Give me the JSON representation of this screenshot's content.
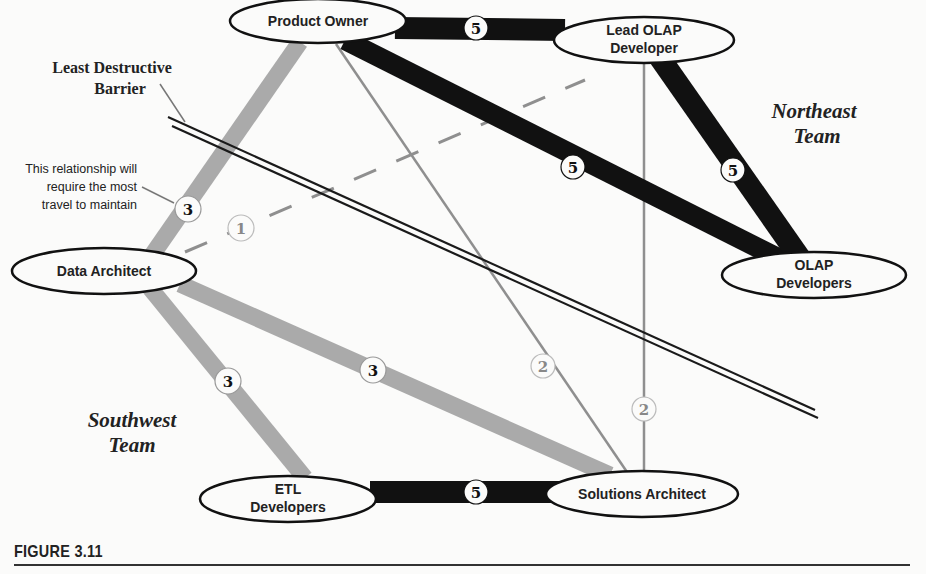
{
  "figure": {
    "caption": "FIGURE 3.11"
  },
  "annotations": {
    "barrier_line1": "Least Destructive",
    "barrier_line2": "Barrier",
    "note_line1": "This relationship will",
    "note_line2": "require the most",
    "note_line3": "travel to maintain"
  },
  "teams": {
    "northeast_line1": "Northeast",
    "northeast_line2": "Team",
    "southwest_line1": "Southwest",
    "southwest_line2": "Team"
  },
  "nodes": {
    "product_owner": {
      "label1": "Product Owner"
    },
    "lead_olap": {
      "label1": "Lead OLAP",
      "label2": "Developer"
    },
    "olap_devs": {
      "label1": "OLAP",
      "label2": "Developers"
    },
    "data_architect": {
      "label1": "Data Architect"
    },
    "etl_devs": {
      "label1": "ETL",
      "label2": "Developers"
    },
    "solutions_architect": {
      "label1": "Solutions Architect"
    }
  },
  "edges": {
    "po_lead": {
      "weight": "5"
    },
    "po_olap": {
      "weight": "5"
    },
    "lead_olap": {
      "weight": "5"
    },
    "etl_sa": {
      "weight": "5"
    },
    "po_da": {
      "weight": "3"
    },
    "da_etl": {
      "weight": "3"
    },
    "da_sa": {
      "weight": "3"
    },
    "da_lead": {
      "weight": "1"
    },
    "po_sa": {
      "weight": "2"
    },
    "lead_sa": {
      "weight": "2"
    }
  },
  "colors": {
    "strong": "#111111",
    "medium": "#a9a9a9",
    "weak": "#9a9a9a",
    "barrier": "#1a1a1a"
  }
}
